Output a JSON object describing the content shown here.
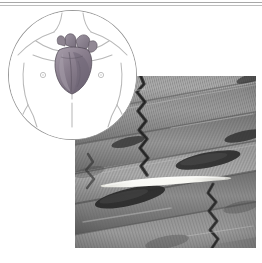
{
  "figure": {
    "caption": "",
    "width": 262,
    "height": 263,
    "background_color": "#ffffff"
  },
  "top_rules": {
    "count": 2,
    "color": "#a8a8a8",
    "secondary_color": "#bdbdbd"
  },
  "inset": {
    "name": "anatomical-location-inset",
    "shape": "circle",
    "border_color": "#9a9a9a",
    "fill_color": "#ffffff",
    "subject": "human torso with heart",
    "line_art_color": "#b4b4b4",
    "heart": {
      "name": "heart-illustration",
      "fill_color": "#8a7f8e",
      "shade_color": "#6d6472",
      "highlight_color": "#a9a0ac",
      "outline_color": "#5d5560"
    },
    "landmarks": [
      {
        "name": "neck-line",
        "type": "line-art"
      },
      {
        "name": "left-shoulder-line",
        "type": "line-art"
      },
      {
        "name": "right-shoulder-line",
        "type": "line-art"
      },
      {
        "name": "clavicle-left-line",
        "type": "line-art"
      },
      {
        "name": "clavicle-right-line",
        "type": "line-art"
      },
      {
        "name": "left-arm-line",
        "type": "line-art"
      },
      {
        "name": "right-arm-line",
        "type": "line-art"
      },
      {
        "name": "torso-midline",
        "type": "line-art"
      },
      {
        "name": "left-nipple-marker",
        "type": "marker"
      },
      {
        "name": "right-nipple-marker",
        "type": "marker"
      }
    ]
  },
  "micrograph": {
    "name": "cardiac-muscle-micrograph",
    "modality": "light microscopy",
    "color_mode": "grayscale",
    "base_color": "#8c8c8c",
    "dark_tone": "#4a4a4a",
    "mid_tone": "#8f8f8f",
    "light_tone": "#c6c6c6",
    "highlight_color": "#fdfdfb",
    "striation_color": "#5a5a5a",
    "features": [
      {
        "name": "muscle-fiber-band",
        "count": 6,
        "orientation": "diagonal"
      },
      {
        "name": "cross-striation",
        "description": "fine transverse banding"
      },
      {
        "name": "intercalated-disc",
        "count": 3,
        "description": "dark zigzag step junction"
      },
      {
        "name": "nucleus",
        "count": 5,
        "description": "dark elongated oval"
      },
      {
        "name": "bright-cleft",
        "count": 1,
        "description": "white lens-shaped sliver"
      }
    ]
  }
}
